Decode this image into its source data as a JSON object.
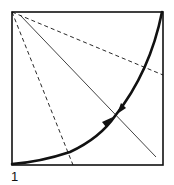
{
  "figure": {
    "label": "1",
    "colors": {
      "stroke": "#111111",
      "background": "#ffffff"
    },
    "square": {
      "x": 12,
      "y": 12,
      "size": 152
    },
    "dashed_lines": [
      {
        "from": [
          12,
          12
        ],
        "to": [
          73,
          165
        ]
      },
      {
        "from": [
          12,
          12
        ],
        "to": [
          163,
          75
        ]
      }
    ],
    "diagonal": {
      "from": [
        20,
        15
      ],
      "to": [
        156,
        157
      ]
    },
    "curve": {
      "from": [
        12,
        165
      ],
      "to": [
        162,
        12
      ],
      "through": [
        115,
        116
      ]
    },
    "arrows": [
      {
        "direction": "up-right",
        "at": [
          110,
          120
        ]
      },
      {
        "direction": "down-left",
        "at": [
          121,
          111
        ]
      }
    ]
  }
}
